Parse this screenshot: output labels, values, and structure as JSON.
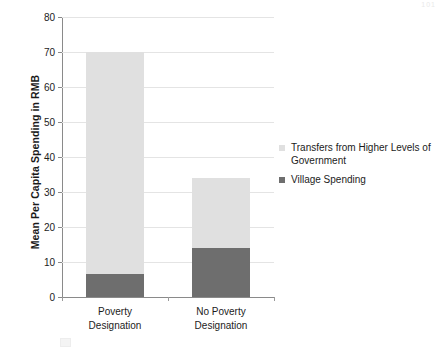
{
  "chart_data": {
    "type": "bar",
    "subtype": "stacked-bar",
    "title": "",
    "xlabel": "",
    "ylabel": "Mean Per Capita Spending in RMB",
    "ylim": [
      0,
      80
    ],
    "yticks": [
      0,
      10,
      20,
      30,
      40,
      50,
      60,
      70,
      80
    ],
    "ytick_labels": [
      "0",
      "10",
      "20",
      "30",
      "40",
      "50",
      "60",
      "70",
      "80"
    ],
    "grid": "horizontal",
    "legend_position": "right",
    "categories": [
      "Poverty Designation",
      "No Poverty Designation"
    ],
    "category_label_lines": [
      [
        "Poverty",
        "Designation"
      ],
      [
        "No Poverty",
        "Designation"
      ]
    ],
    "series": [
      {
        "name": "Village Spending",
        "color": "#6e6e6e",
        "values": [
          6.5,
          14
        ]
      },
      {
        "name": "Transfers from Higher Levels of Government",
        "color": "#e0e0e0",
        "values": [
          63.5,
          20
        ]
      }
    ],
    "stack_totals": [
      70,
      34
    ]
  },
  "legend": {
    "items": [
      {
        "label": "Transfers from Higher Levels of Government",
        "color": "#e0e0e0"
      },
      {
        "label": "Village Spending",
        "color": "#6e6e6e"
      }
    ]
  },
  "artifacts": {
    "page_number": "101"
  }
}
